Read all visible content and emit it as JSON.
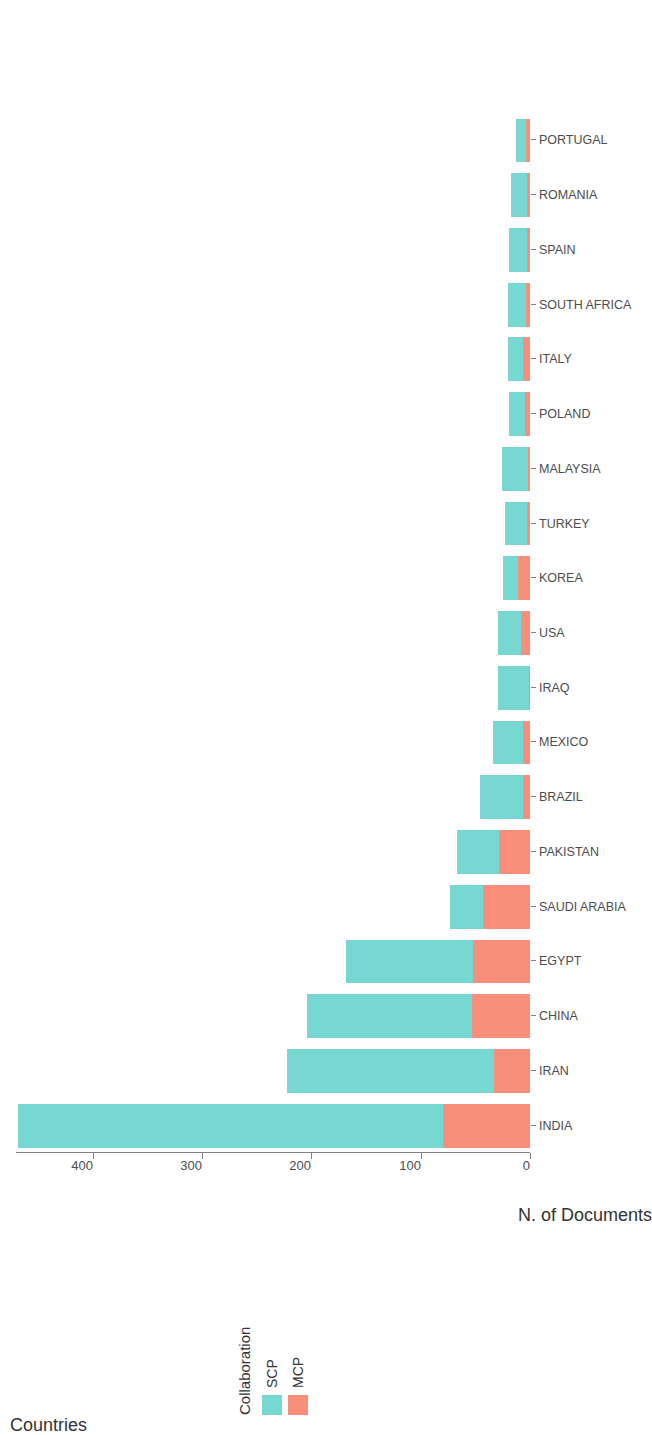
{
  "chart_data": {
    "type": "bar",
    "orientation": "vertical-rotated",
    "title": "",
    "xlabel": "Countries",
    "ylabel": "N. of Documents",
    "legend_title": "Collaboration",
    "legend_position": "top-left",
    "grid": false,
    "ylim": [
      0,
      470
    ],
    "yticks": [
      0,
      100,
      200,
      300,
      400
    ],
    "ytick_labels": [
      "0",
      "100",
      "200",
      "300",
      "400"
    ],
    "categories": [
      "INDIA",
      "IRAN",
      "CHINA",
      "EGYPT",
      "SAUDI ARABIA",
      "PAKISTAN",
      "BRAZIL",
      "MEXICO",
      "IRAQ",
      "USA",
      "KOREA",
      "TURKEY",
      "MALAYSIA",
      "POLAND",
      "ITALY",
      "SOUTH AFRICA",
      "SPAIN",
      "ROMANIA",
      "PORTUGAL"
    ],
    "series": [
      {
        "name": "SCP",
        "color": "#76D7D3",
        "values": [
          388,
          189,
          151,
          116,
          30,
          39,
          40,
          28,
          28,
          21,
          14,
          20,
          24,
          14,
          14,
          16,
          16,
          14,
          9
        ]
      },
      {
        "name": "MCP",
        "color": "#F98E7B",
        "values": [
          80,
          33,
          53,
          52,
          43,
          28,
          6,
          6,
          1,
          8,
          11,
          3,
          2,
          5,
          6,
          4,
          3,
          3,
          4
        ]
      }
    ],
    "totals": [
      468,
      222,
      204,
      168,
      73,
      67,
      46,
      34,
      29,
      29,
      25,
      23,
      26,
      19,
      20,
      20,
      19,
      17,
      13
    ]
  },
  "legend": {
    "title": "Collaboration",
    "items": [
      {
        "label": "SCP",
        "color": "#76D7D3"
      },
      {
        "label": "MCP",
        "color": "#F98E7B"
      }
    ]
  },
  "axes": {
    "value_axis_title": "N. of Documents",
    "category_axis_title": "Countries",
    "value_ticks": [
      "0",
      "100",
      "200",
      "300",
      "400"
    ]
  }
}
